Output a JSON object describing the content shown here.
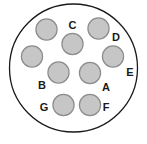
{
  "diagram": {
    "type": "electrical-connector-pinout",
    "shell": {
      "name": "connector-shell",
      "cx": 73.5,
      "cy": 68,
      "r": 64,
      "fill": "#ffffff",
      "stroke": "#1a1a1a",
      "stroke_width": 1.3
    },
    "pin_style": {
      "r": 10.6,
      "fill": "#c6c6c6",
      "stroke": "#8c8c8c",
      "stroke_width": 1.2
    },
    "pins": [
      {
        "id": "pin-top-left",
        "label": "",
        "cx": 46.5,
        "cy": 29.5
      },
      {
        "id": "pin-top-right",
        "label": "D",
        "cx": 98.5,
        "cy": 28.5,
        "label_x": 116,
        "label_y": 41
      },
      {
        "id": "pin-upper-center",
        "label": "C",
        "cx": 72.5,
        "cy": 44.0,
        "label_x": 72.5,
        "label_y": 29
      },
      {
        "id": "pin-left",
        "label": "",
        "cx": 32.0,
        "cy": 56.5
      },
      {
        "id": "pin-right",
        "label": "E",
        "cx": 113.0,
        "cy": 56.5,
        "label_x": 130,
        "label_y": 76
      },
      {
        "id": "pin-center-left",
        "label": "B",
        "cx": 58.5,
        "cy": 72.5,
        "label_x": 42,
        "label_y": 89
      },
      {
        "id": "pin-center-right",
        "label": "A",
        "cx": 90.0,
        "cy": 73.0,
        "label_x": 106,
        "label_y": 91
      },
      {
        "id": "pin-bottom-left",
        "label": "G",
        "cx": 63.5,
        "cy": 105.0,
        "label_x": 44,
        "label_y": 111
      },
      {
        "id": "pin-bottom-right",
        "label": "F",
        "cx": 90.0,
        "cy": 105.0,
        "label_x": 106,
        "label_y": 111
      }
    ],
    "labels": [
      {
        "text": "A",
        "x": 106,
        "y": 91
      },
      {
        "text": "B",
        "x": 42,
        "y": 89
      },
      {
        "text": "C",
        "x": 72.5,
        "y": 29
      },
      {
        "text": "D",
        "x": 116,
        "y": 41
      },
      {
        "text": "E",
        "x": 130,
        "y": 76
      },
      {
        "text": "F",
        "x": 106,
        "y": 111
      },
      {
        "text": "G",
        "x": 44,
        "y": 111
      }
    ]
  }
}
